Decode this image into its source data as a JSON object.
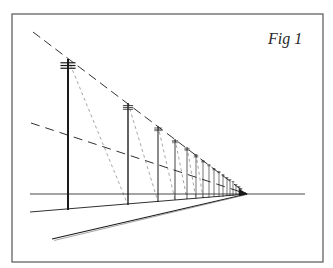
{
  "figure": {
    "label": "Fig 1"
  },
  "colors": {
    "background": "#ffffff",
    "ink": "#1a1a1a",
    "frame": "#555555",
    "construction": "#6a6a6a"
  },
  "geometry": {
    "frame": {
      "x": 12,
      "y": 14,
      "w": 311,
      "h": 248
    },
    "horizon_y": 194,
    "vanishing_point": {
      "x": 247,
      "y": 194
    },
    "horizon_line": {
      "x1": 30,
      "x2": 305
    },
    "poles": [
      {
        "x": 68,
        "top": 59,
        "bottom": 210
      },
      {
        "x": 128,
        "top": 103,
        "bottom": 205
      },
      {
        "x": 158,
        "top": 126,
        "bottom": 202
      },
      {
        "x": 175,
        "top": 139,
        "bottom": 200
      },
      {
        "x": 187,
        "top": 147,
        "bottom": 199
      },
      {
        "x": 196,
        "top": 154,
        "bottom": 199
      },
      {
        "x": 203,
        "top": 160,
        "bottom": 198
      },
      {
        "x": 209,
        "top": 164,
        "bottom": 198
      },
      {
        "x": 214,
        "top": 168,
        "bottom": 197
      },
      {
        "x": 219,
        "top": 171,
        "bottom": 197
      },
      {
        "x": 223,
        "top": 174,
        "bottom": 197
      },
      {
        "x": 227,
        "top": 177,
        "bottom": 196
      },
      {
        "x": 230,
        "top": 179,
        "bottom": 196
      },
      {
        "x": 233,
        "top": 181,
        "bottom": 196
      },
      {
        "x": 236,
        "top": 184,
        "bottom": 195
      },
      {
        "x": 239,
        "top": 186,
        "bottom": 195
      },
      {
        "x": 241,
        "top": 188,
        "bottom": 195
      }
    ],
    "top_wire_start": {
      "x": 33,
      "y": 32
    },
    "mid_wire_start": {
      "x": 31,
      "y": 123
    },
    "pole_base_line_start": {
      "x": 30,
      "y": 212
    },
    "road_edge_start": {
      "x": 52,
      "y": 239
    }
  }
}
